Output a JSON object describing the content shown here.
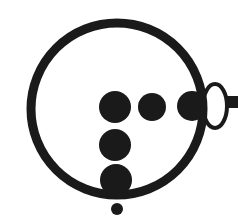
{
  "figure": {
    "canvas": {
      "width": 238,
      "height": 223,
      "background": "#ffffff"
    },
    "colors": {
      "ink": "#1a1a1a",
      "fill": "#ffffff"
    },
    "caption": "Diagram: large open ring containing five filled dots, an open ellipse attached at the right rim, and a small dot below the ring."
  },
  "chart_data": {
    "type": "scatter",
    "xlabel": "",
    "ylabel": "",
    "xlim": [
      0,
      238
    ],
    "ylim": [
      0,
      223
    ],
    "grid": false,
    "legend": "none",
    "shapes": [
      {
        "name": "main-ring",
        "kind": "circle-outline",
        "cx": 117,
        "cy": 109,
        "r": 86,
        "stroke_width": 9,
        "stroke": "#1a1a1a",
        "fill": "none"
      },
      {
        "name": "open-ellipse",
        "kind": "ellipse-outline",
        "cx": 215,
        "cy": 106,
        "rx": 12,
        "ry": 22,
        "stroke_width": 4,
        "stroke": "#1a1a1a",
        "fill": "#ffffff"
      },
      {
        "name": "right-stub-bar",
        "kind": "rect",
        "x": 226,
        "y": 96,
        "width": 12,
        "height": 12,
        "fill": "#1a1a1a"
      }
    ],
    "points": [
      {
        "name": "dot-row1-left",
        "label": "dot 1",
        "cx": 115,
        "cy": 107,
        "r": 16,
        "fill": "#1a1a1a"
      },
      {
        "name": "dot-row1-mid",
        "label": "dot 2",
        "cx": 152,
        "cy": 107,
        "r": 14,
        "fill": "#1a1a1a"
      },
      {
        "name": "dot-row1-right",
        "label": "dot 3",
        "cx": 192,
        "cy": 106,
        "r": 15,
        "fill": "#1a1a1a"
      },
      {
        "name": "dot-row2",
        "label": "dot 4",
        "cx": 115,
        "cy": 145,
        "r": 16,
        "fill": "#1a1a1a"
      },
      {
        "name": "dot-row3",
        "label": "dot 5",
        "cx": 116,
        "cy": 180,
        "r": 16,
        "fill": "#1a1a1a"
      },
      {
        "name": "dot-small-below",
        "label": "dot 6",
        "cx": 117,
        "cy": 209,
        "r": 6,
        "fill": "#1a1a1a"
      }
    ]
  }
}
